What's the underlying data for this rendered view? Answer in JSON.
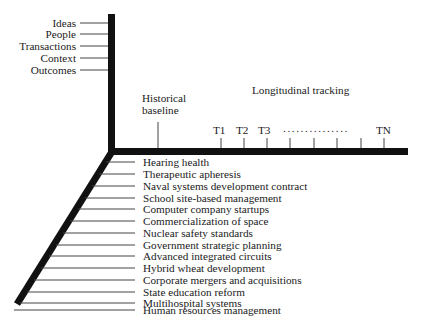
{
  "diagram": {
    "dimensions_axis": {
      "items": [
        "Ideas",
        "People",
        "Transactions",
        "Context",
        "Outcomes"
      ]
    },
    "time_axis": {
      "baseline_label_line1": "Historical",
      "baseline_label_line2": "baseline",
      "tracking_label": "Longitudinal tracking",
      "ticks": [
        "T1",
        "T2",
        "T3"
      ],
      "ellipsis": "...............",
      "last_tick": "TN"
    },
    "cases_axis": {
      "items": [
        "Hearing health",
        "Therapeutic apheresis",
        "Naval systems development contract",
        "School site-based management",
        "Computer company startups",
        "Commercialization of space",
        "Nuclear safety standards",
        "Government strategic planning",
        "Advanced integrated circuits",
        "Hybrid wheat development",
        "Corporate mergers and acquisitions",
        "State education reform",
        "Multihospital systems",
        "Human resources management"
      ]
    },
    "colors": {
      "axis": "#111111",
      "line": "#444444",
      "background": "#ffffff"
    }
  }
}
